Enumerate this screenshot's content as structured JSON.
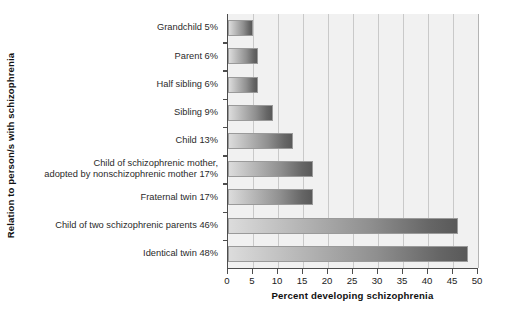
{
  "chart_data": {
    "type": "bar",
    "orientation": "horizontal",
    "title": "",
    "xlabel": "Percent developing schizophrenia",
    "ylabel": "Relation to person/s with schizophrenia",
    "xlim": [
      0,
      50
    ],
    "xticks": [
      0,
      5,
      10,
      15,
      20,
      25,
      30,
      35,
      40,
      45,
      50
    ],
    "xtick_labels": [
      "0",
      "5",
      "10",
      "15",
      "20",
      "25",
      "30",
      "35",
      "40",
      "45",
      "50"
    ],
    "grid": "vertical",
    "legend": "none",
    "categories": [
      "Grandchild 5%",
      "Parent 6%",
      "Half sibling 6%",
      "Sibling 9%",
      "Child 13%",
      "Child of schizophrenic mother,\nadopted by nonschizophrenic mother 17%",
      "Fraternal twin 17%",
      "Child of two schizophrenic parents 46%",
      "Identical twin 48%"
    ],
    "values": [
      5,
      6,
      6,
      9,
      13,
      17,
      17,
      46,
      48
    ],
    "bar_color_start": "#dcdcdc",
    "bar_color_end": "#595959",
    "plot_background": "#f1f1f1",
    "gridline_color": "#c9c9c9",
    "axis_color": "#4d4d4d"
  }
}
